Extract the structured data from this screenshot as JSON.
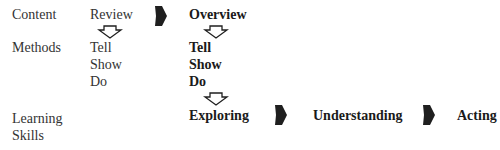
{
  "row_labels": {
    "content": "Content",
    "methods": "Methods",
    "learning_skills_line1": "Learning",
    "learning_skills_line2": "Skills"
  },
  "review_column": {
    "heading": "Review",
    "methods": [
      "Tell",
      "Show",
      "Do"
    ]
  },
  "overview_column": {
    "heading": "Overview",
    "methods": [
      "Tell",
      "Show",
      "Do"
    ]
  },
  "learning_skills": [
    "Exploring",
    "Understanding",
    "Acting"
  ],
  "arrows": {
    "right_arrow_icon": "filled-right-arrow",
    "down_arrow_icon": "hollow-down-arrow",
    "fill_color": "#1f1f1f",
    "outline_color": "#1f1f1f"
  }
}
